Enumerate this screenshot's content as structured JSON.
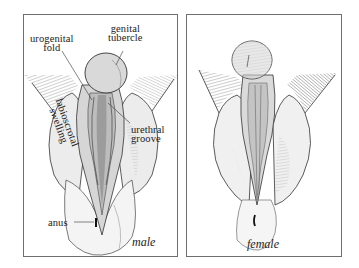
{
  "figure": {
    "panels": [
      {
        "id": "male",
        "caption": "male",
        "labels": {
          "urogenital_fold": [
            "urogenital",
            "fold"
          ],
          "genital_tubercle": [
            "genital",
            "tubercle"
          ],
          "labioscrotal_swelling": [
            "labioscrotal",
            "swelling"
          ],
          "urethral_groove": [
            "urethral",
            "groove"
          ],
          "anus": "anus"
        }
      },
      {
        "id": "female",
        "caption": "female"
      }
    ],
    "colors": {
      "border": "#6e6e6e",
      "ink": "#222222",
      "skin_light": "#e9e9e9",
      "skin_mid": "#cfcfcf",
      "shade_dark": "#8a8a8a",
      "background": "#ffffff"
    }
  }
}
